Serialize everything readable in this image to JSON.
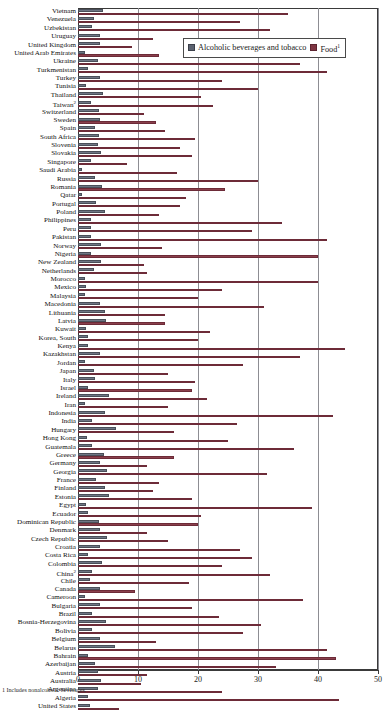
{
  "legend": {
    "series1_label": "Alcoholic beverages and tobacco",
    "series2_label": "Food",
    "series2_footnote_marker": "1"
  },
  "axis": {
    "ticks": [
      "0",
      "10",
      "20",
      "30",
      "40",
      "50"
    ],
    "min": 0,
    "max": 50
  },
  "footnote": {
    "text": "1 Includes nonalcoholic beverages."
  },
  "colors": {
    "series1": "#6e7584",
    "series2": "#8a3f4c",
    "gridline": "#8d8d93",
    "frame": "#3a3a3a"
  },
  "chart_data": {
    "type": "bar",
    "orientation": "horizontal",
    "title": "",
    "xlabel": "",
    "ylabel": "",
    "xlim": [
      0,
      50
    ],
    "grid": true,
    "legend_position": "top-right-inside",
    "categories": [
      "Vietnam",
      "Venezuela",
      "Uzbekistan",
      "Uruguay",
      "United Kingdom",
      "United Arab Emirates",
      "Ukraine",
      "Turkmenistan",
      "Turkey",
      "Tunisia",
      "Thailand",
      "Taiwan",
      "Switzerland",
      "Sweden",
      "Spain",
      "South Africa",
      "Slovenia",
      "Slovakia",
      "Singapore",
      "Saudi Arabia",
      "Russia",
      "Romania",
      "Qatar",
      "Portugal",
      "Poland",
      "Philippines",
      "Peru",
      "Pakistan",
      "Norway",
      "Nigeria",
      "New Zealand",
      "Netherlands",
      "Morocco",
      "Mexico",
      "Malaysia",
      "Macedonia",
      "Lithuania",
      "Latvia",
      "Kuwait",
      "Korea, South",
      "Kenya",
      "Kazakhstan",
      "Jordan",
      "Japan",
      "Italy",
      "Israel",
      "Ireland",
      "Iran",
      "Indonesia",
      "India",
      "Hungary",
      "Hong Kong",
      "Guatemala",
      "Greece",
      "Germany",
      "Georgia",
      "France",
      "Finland",
      "Estonia",
      "Egypt",
      "Ecuador",
      "Dominican Republic",
      "Denmark",
      "Czech Republic",
      "Croatia",
      "Costa Rica",
      "Colombia",
      "China",
      "Chile",
      "Canada",
      "Cameroon",
      "Bulgaria",
      "Brazil",
      "Bosnia-Herzegovina",
      "Bolivia",
      "Belgium",
      "Belarus",
      "Bahrain",
      "Azerbaijan",
      "Austria",
      "Australia",
      "Argentina",
      "Algeria",
      "United States"
    ],
    "category_footnotes": {
      "Taiwan": "2",
      "China": "2"
    },
    "series": [
      {
        "name": "Alcoholic beverages and tobacco",
        "values": [
          4.1,
          2.6,
          2.3,
          3.6,
          3.6,
          1.2,
          3.4,
          1.7,
          3.6,
          1.4,
          4.2,
          2.1,
          3.5,
          3.6,
          2.9,
          3.5,
          3.3,
          3.9,
          2.1,
          0.7,
          2.9,
          4.0,
          0.6,
          3.0,
          4.5,
          2.1,
          2.2,
          2.2,
          3.8,
          2.2,
          3.9,
          2.6,
          1.2,
          1.4,
          1.1,
          3.6,
          4.5,
          4.6,
          1.3,
          1.7,
          1.6,
          3.6,
          1.1,
          2.6,
          2.9,
          1.6,
          5.2,
          1.1,
          4.5,
          2.4,
          6.3,
          1.5,
          2.3,
          4.4,
          3.6,
          4.8,
          3.0,
          4.5,
          5.1,
          1.3,
          1.6,
          3.5,
          3.6,
          4.9,
          3.7,
          1.6,
          4.0,
          2.4,
          2.0,
          3.6,
          1.2,
          3.7,
          2.3,
          4.7,
          2.4,
          3.6,
          6.2,
          1.6,
          2.8,
          3.4,
          3.9,
          3.3,
          1.7,
          2.0
        ]
      },
      {
        "name": "Food",
        "values": [
          35.0,
          27.0,
          32.0,
          12.5,
          9.0,
          13.5,
          37.0,
          41.5,
          24.0,
          30.0,
          20.5,
          22.5,
          11.0,
          13.0,
          14.5,
          19.5,
          17.0,
          19.0,
          8.2,
          16.5,
          30.0,
          24.5,
          18.0,
          17.0,
          13.5,
          34.0,
          29.0,
          41.5,
          14.0,
          40.0,
          11.0,
          11.5,
          40.0,
          24.0,
          20.0,
          31.0,
          14.5,
          14.5,
          22.0,
          20.0,
          44.5,
          37.0,
          27.5,
          15.0,
          19.5,
          19.0,
          21.5,
          15.0,
          42.5,
          26.5,
          16.0,
          25.0,
          36.0,
          16.0,
          11.5,
          31.5,
          13.5,
          12.5,
          19.0,
          39.0,
          20.5,
          20.0,
          11.5,
          15.0,
          27.0,
          29.0,
          24.0,
          32.0,
          18.5,
          9.5,
          37.5,
          19.0,
          23.5,
          30.5,
          27.5,
          13.0,
          41.5,
          43.0,
          33.0,
          11.5,
          10.5,
          24.0,
          43.5,
          6.8
        ]
      }
    ]
  }
}
